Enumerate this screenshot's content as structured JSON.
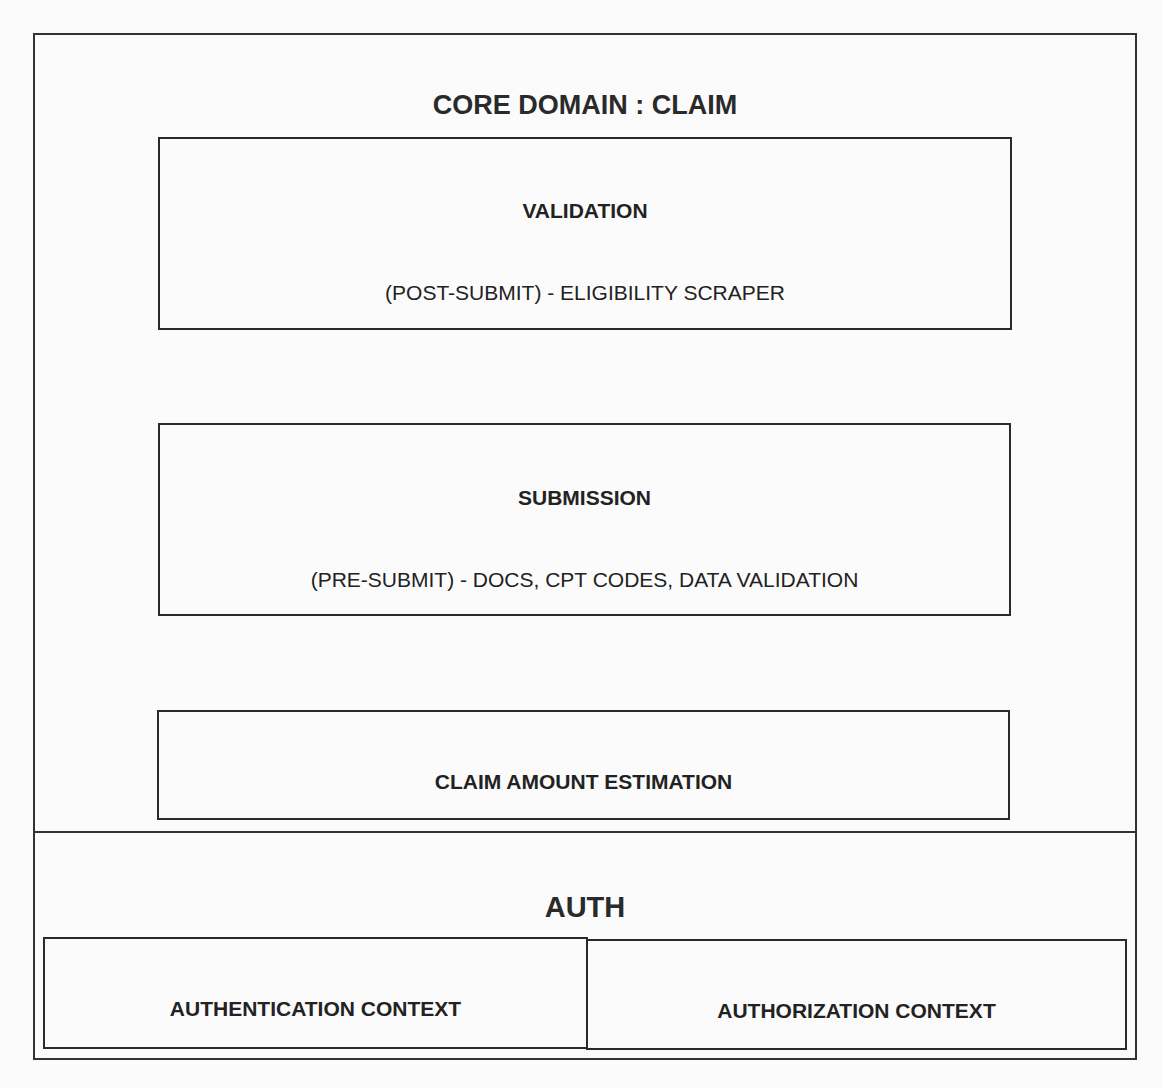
{
  "diagram": {
    "core_domain": {
      "title": "CORE DOMAIN : CLAIM",
      "components": [
        {
          "name": "VALIDATION",
          "description": "(POST-SUBMIT) - ELIGIBILITY SCRAPER"
        },
        {
          "name": "SUBMISSION",
          "description": "(PRE-SUBMIT) - DOCS, CPT CODES, DATA VALIDATION"
        },
        {
          "name": "CLAIM AMOUNT ESTIMATION"
        }
      ]
    },
    "auth": {
      "title": "AUTH",
      "contexts": [
        {
          "name": "AUTHENTICATION CONTEXT"
        },
        {
          "name": "AUTHORIZATION CONTEXT"
        }
      ]
    }
  },
  "colors": {
    "border": "#2a2a2a",
    "text": "#222222",
    "background": "#fbfbfb"
  }
}
